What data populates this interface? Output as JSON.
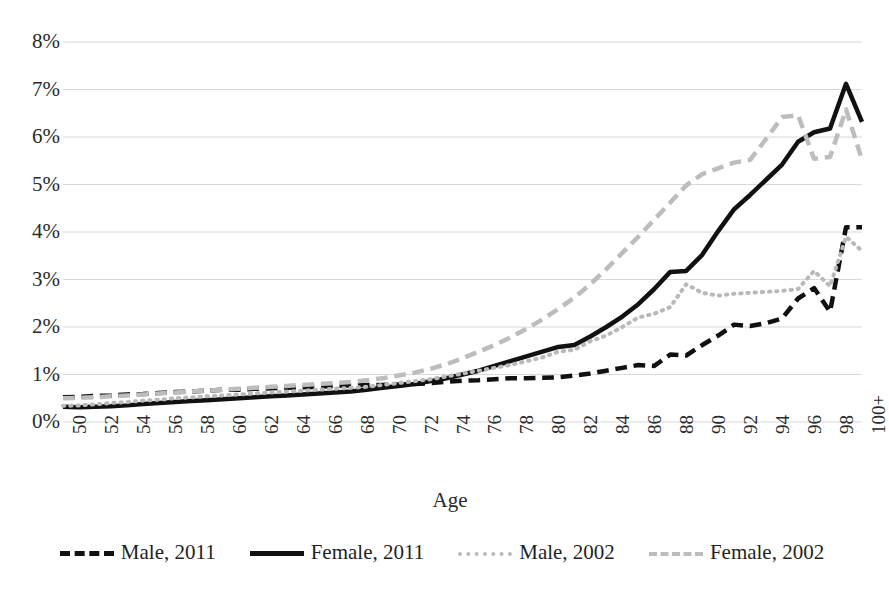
{
  "chart_data": {
    "type": "line",
    "title": "",
    "xlabel": "Age",
    "ylabel": "",
    "xlim": [
      50,
      100
    ],
    "ylim": [
      0,
      8
    ],
    "grid": true,
    "legend_position": "bottom",
    "ytick_labels": [
      "8%",
      "7%",
      "6%",
      "5%",
      "4%",
      "3%",
      "2%",
      "1%",
      "0%"
    ],
    "ytick_values": [
      8,
      7,
      6,
      5,
      4,
      3,
      2,
      1,
      0
    ],
    "xtick_labels": [
      "50",
      "52",
      "54",
      "56",
      "58",
      "60",
      "62",
      "64",
      "66",
      "68",
      "70",
      "72",
      "74",
      "76",
      "78",
      "80",
      "82",
      "84",
      "86",
      "88",
      "90",
      "92",
      "94",
      "96",
      "98",
      "100+"
    ],
    "x": [
      50,
      51,
      52,
      53,
      54,
      55,
      56,
      57,
      58,
      59,
      60,
      61,
      62,
      63,
      64,
      65,
      66,
      67,
      68,
      69,
      70,
      71,
      72,
      73,
      74,
      75,
      76,
      77,
      78,
      79,
      80,
      81,
      82,
      83,
      84,
      85,
      86,
      87,
      88,
      89,
      90,
      91,
      92,
      93,
      94,
      95,
      96,
      97,
      98,
      99,
      100
    ],
    "series": [
      {
        "name": "Male, 2011",
        "color": "#111111",
        "style": "dashed",
        "width": 4.5,
        "values": [
          0.52,
          0.53,
          0.55,
          0.56,
          0.58,
          0.59,
          0.61,
          0.63,
          0.64,
          0.66,
          0.68,
          0.68,
          0.7,
          0.71,
          0.72,
          0.73,
          0.74,
          0.76,
          0.77,
          0.78,
          0.78,
          0.79,
          0.8,
          0.82,
          0.85,
          0.87,
          0.88,
          0.9,
          0.92,
          0.92,
          0.93,
          0.94,
          0.98,
          1.02,
          1.08,
          1.14,
          1.2,
          1.18,
          1.42,
          1.4,
          1.62,
          1.82,
          2.05,
          2.02,
          2.08,
          2.18,
          2.6,
          2.82,
          2.32,
          4.1,
          4.1
        ]
      },
      {
        "name": "Female, 2011",
        "color": "#111111",
        "style": "solid",
        "width": 4.5,
        "values": [
          0.32,
          0.31,
          0.32,
          0.33,
          0.35,
          0.38,
          0.4,
          0.42,
          0.44,
          0.46,
          0.48,
          0.5,
          0.52,
          0.54,
          0.56,
          0.58,
          0.6,
          0.62,
          0.64,
          0.68,
          0.72,
          0.76,
          0.8,
          0.86,
          0.92,
          1.0,
          1.08,
          1.18,
          1.28,
          1.38,
          1.48,
          1.58,
          1.62,
          1.8,
          2.0,
          2.22,
          2.48,
          2.8,
          3.16,
          3.18,
          3.52,
          4.02,
          4.48,
          4.78,
          5.1,
          5.42,
          5.9,
          6.1,
          6.18,
          7.12,
          6.32
        ]
      },
      {
        "name": "Male, 2002",
        "color": "#b9b9b9",
        "style": "dotted",
        "width": 4.0,
        "values": [
          0.34,
          0.35,
          0.37,
          0.4,
          0.42,
          0.45,
          0.47,
          0.5,
          0.52,
          0.54,
          0.56,
          0.58,
          0.6,
          0.62,
          0.64,
          0.66,
          0.68,
          0.7,
          0.72,
          0.74,
          0.78,
          0.82,
          0.86,
          0.9,
          0.96,
          1.02,
          1.08,
          1.14,
          1.2,
          1.28,
          1.36,
          1.48,
          1.52,
          1.7,
          1.82,
          2.0,
          2.2,
          2.28,
          2.42,
          2.9,
          2.72,
          2.66,
          2.7,
          2.72,
          2.74,
          2.76,
          2.8,
          3.18,
          2.86,
          3.9,
          3.6
        ]
      },
      {
        "name": "Female, 2002",
        "color": "#bdbdbd",
        "style": "dashed",
        "width": 4.5,
        "values": [
          0.5,
          0.51,
          0.52,
          0.54,
          0.56,
          0.58,
          0.6,
          0.62,
          0.64,
          0.66,
          0.68,
          0.7,
          0.72,
          0.74,
          0.76,
          0.78,
          0.8,
          0.82,
          0.84,
          0.88,
          0.92,
          0.98,
          1.04,
          1.12,
          1.22,
          1.34,
          1.48,
          1.62,
          1.78,
          1.96,
          2.16,
          2.38,
          2.62,
          2.9,
          3.22,
          3.56,
          3.9,
          4.26,
          4.62,
          4.98,
          5.22,
          5.34,
          5.46,
          5.52,
          5.96,
          6.42,
          6.46,
          5.54,
          5.58,
          6.58,
          5.52
        ]
      }
    ]
  },
  "axis": {
    "x_title": "Age"
  },
  "legend": {
    "items": [
      {
        "label": "Male, 2011"
      },
      {
        "label": "Female, 2011"
      },
      {
        "label": "Male, 2002"
      },
      {
        "label": "Female, 2002"
      }
    ]
  }
}
